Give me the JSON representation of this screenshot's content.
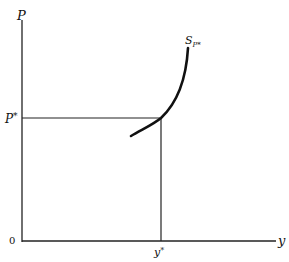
{
  "diagram": {
    "type": "supply-curve-equilibrium",
    "axes": {
      "y_axis_label": "P",
      "x_axis_label": "y",
      "origin_label": "0"
    },
    "curve": {
      "name": "S",
      "subscript": "P*"
    },
    "equilibrium": {
      "price_label": "P",
      "price_superscript": "*",
      "quantity_label": "y",
      "quantity_superscript": "*"
    },
    "colors": {
      "line": "#111111",
      "background": "#ffffff"
    }
  }
}
